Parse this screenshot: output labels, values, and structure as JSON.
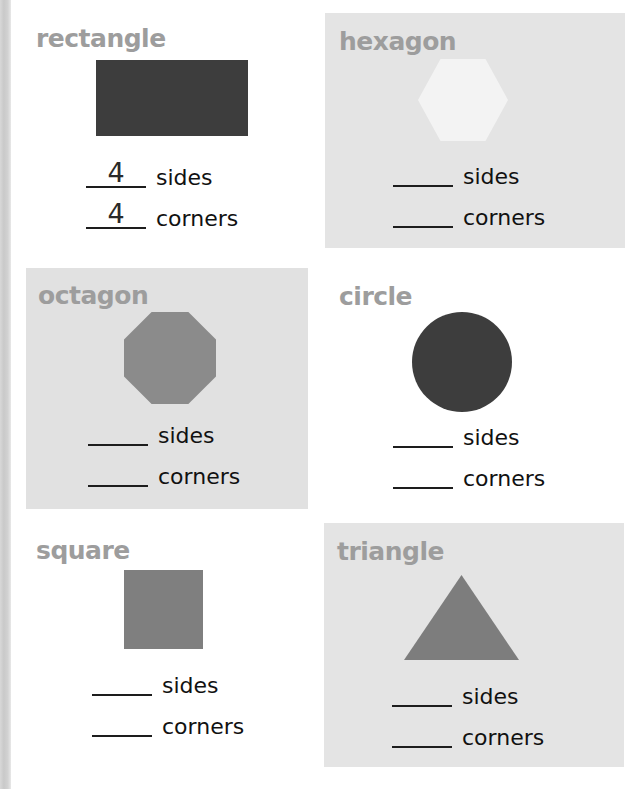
{
  "worksheet": {
    "title_color": "#9d9d9d",
    "page_background": "#ffffff",
    "edge_strip_color": "#d0d0d0",
    "sides_label": "sides",
    "corners_label": "corners",
    "blank_placeholder": "____"
  },
  "panels": [
    {
      "name": "rectangle",
      "title": "rectangle",
      "shape": "rectangle-shape",
      "panel_background": "#ffffff",
      "shape_color": "#3d3d3d",
      "sides_label": "sides",
      "corners_label": "corners",
      "sides_answer": "4",
      "corners_answer": "4"
    },
    {
      "name": "hexagon",
      "title": "hexagon",
      "shape": "hexagon-shape",
      "panel_background": "#e4e4e4",
      "shape_color": "#f3f3f3",
      "sides_label": "sides",
      "corners_label": "corners",
      "sides_answer": "",
      "corners_answer": ""
    },
    {
      "name": "octagon",
      "title": "octagon",
      "shape": "octagon-shape",
      "panel_background": "#e1e1e1",
      "shape_color": "#8b8b8b",
      "sides_label": "sides",
      "corners_label": "corners",
      "sides_answer": "",
      "corners_answer": ""
    },
    {
      "name": "circle",
      "title": "circle",
      "shape": "circle-shape",
      "panel_background": "#ffffff",
      "shape_color": "#3d3d3d",
      "sides_label": "sides",
      "corners_label": "corners",
      "sides_answer": "",
      "corners_answer": ""
    },
    {
      "name": "square",
      "title": "square",
      "shape": "square-shape",
      "panel_background": "#ffffff",
      "shape_color": "#7f7f7f",
      "sides_label": "sides",
      "corners_label": "corners",
      "sides_answer": "",
      "corners_answer": ""
    },
    {
      "name": "triangle",
      "title": "triangle",
      "shape": "triangle-shape",
      "panel_background": "#e4e4e4",
      "shape_color": "#7d7d7d",
      "sides_label": "sides",
      "corners_label": "corners",
      "sides_answer": "",
      "corners_answer": ""
    }
  ]
}
